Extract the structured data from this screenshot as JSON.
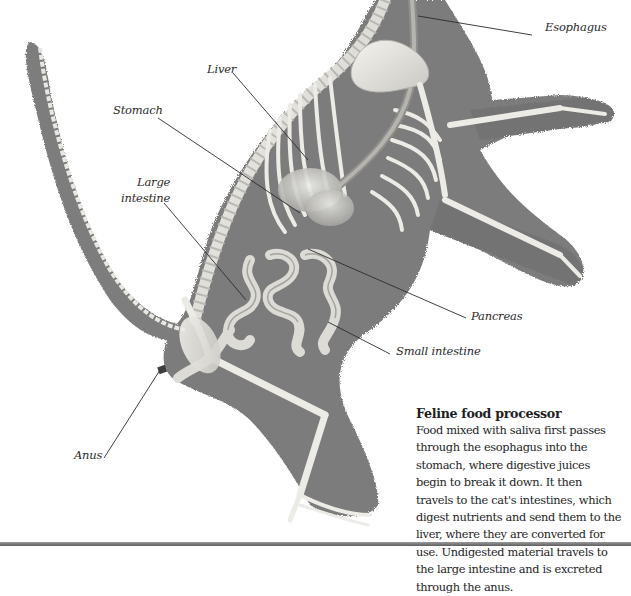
{
  "figure": {
    "colors": {
      "background": "#ffffff",
      "silhouette": "#7b7b7b",
      "silhouette_dark": "#6a6a6a",
      "bone": "#ecebe6",
      "bone_shade": "#c9c8c2",
      "organ": "#d6d5d0",
      "organ_shade": "#a9a8a3",
      "leader_line": "#2b2b2b",
      "text": "#1e1e1e",
      "bottom_rule": "#6e6e6e"
    }
  },
  "labels": [
    {
      "id": "esophagus",
      "text": "Esophagus",
      "x": 545,
      "y": 26,
      "align": "left",
      "line": {
        "x1": 418,
        "y1": 16,
        "x2": 532,
        "y2": 35
      }
    },
    {
      "id": "liver",
      "text": "Liver",
      "x": 207,
      "y": 62,
      "align": "left",
      "line": {
        "x1": 233,
        "y1": 73,
        "x2": 308,
        "y2": 160
      }
    },
    {
      "id": "stomach",
      "text": "Stomach",
      "x": 113,
      "y": 103,
      "align": "left",
      "line": {
        "x1": 158,
        "y1": 118,
        "x2": 300,
        "y2": 213
      }
    },
    {
      "id": "large-intestine-1",
      "text": "Large",
      "x": 137,
      "y": 175,
      "align": "right"
    },
    {
      "id": "large-intestine-2",
      "text": "intestine",
      "x": 121,
      "y": 191,
      "align": "right",
      "line": {
        "x1": 164,
        "y1": 203,
        "x2": 246,
        "y2": 300
      }
    },
    {
      "id": "pancreas",
      "text": "Pancreas",
      "x": 471,
      "y": 309,
      "align": "left",
      "line": {
        "x1": 308,
        "y1": 249,
        "x2": 466,
        "y2": 318
      }
    },
    {
      "id": "small-intestine",
      "text": "Small intestine",
      "x": 396,
      "y": 344,
      "align": "left",
      "line": {
        "x1": 328,
        "y1": 322,
        "x2": 390,
        "y2": 354
      }
    },
    {
      "id": "anus",
      "text": "Anus",
      "x": 74,
      "y": 448,
      "align": "left",
      "line": {
        "x1": 104,
        "y1": 458,
        "x2": 160,
        "y2": 370
      }
    }
  ],
  "caption": {
    "title": "Feline food processor",
    "lines": [
      "Food mixed with saliva first passes",
      "through the esophagus into the",
      "stomach, where digestive juices",
      "begin to break it down. It then",
      "travels to the cat's intestines, which",
      "digest nutrients and send them to the",
      "liver, where they are converted for",
      "use. Undigested material travels to",
      "the large intestine and is excreted",
      "through the anus."
    ]
  }
}
